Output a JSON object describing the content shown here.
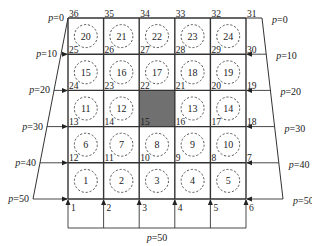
{
  "diagram": {
    "type": "finite-element-grid",
    "grid": {
      "columns": 5,
      "rows": 5
    },
    "elements": [
      {
        "id": "20",
        "row": 0,
        "col": 0
      },
      {
        "id": "21",
        "row": 0,
        "col": 1
      },
      {
        "id": "22",
        "row": 0,
        "col": 2
      },
      {
        "id": "23",
        "row": 0,
        "col": 3
      },
      {
        "id": "24",
        "row": 0,
        "col": 4
      },
      {
        "id": "15",
        "row": 1,
        "col": 0
      },
      {
        "id": "16",
        "row": 1,
        "col": 1
      },
      {
        "id": "17",
        "row": 1,
        "col": 2
      },
      {
        "id": "18",
        "row": 1,
        "col": 3
      },
      {
        "id": "19",
        "row": 1,
        "col": 4
      },
      {
        "id": "11",
        "row": 2,
        "col": 0
      },
      {
        "id": "12",
        "row": 2,
        "col": 1
      },
      {
        "id": "13",
        "row": 2,
        "col": 3
      },
      {
        "id": "14",
        "row": 2,
        "col": 4
      },
      {
        "id": "6",
        "row": 3,
        "col": 0
      },
      {
        "id": "7",
        "row": 3,
        "col": 1
      },
      {
        "id": "8",
        "row": 3,
        "col": 2
      },
      {
        "id": "9",
        "row": 3,
        "col": 3
      },
      {
        "id": "10",
        "row": 3,
        "col": 4
      },
      {
        "id": "1",
        "row": 4,
        "col": 0
      },
      {
        "id": "2",
        "row": 4,
        "col": 1
      },
      {
        "id": "3",
        "row": 4,
        "col": 2
      },
      {
        "id": "4",
        "row": 4,
        "col": 3
      },
      {
        "id": "5",
        "row": 4,
        "col": 4
      }
    ],
    "shaded_cell": {
      "row": 2,
      "col": 2,
      "color": "#707070"
    },
    "top_nodes": [
      "36",
      "35",
      "34",
      "33",
      "32",
      "31"
    ],
    "row1_nodes": [
      "25",
      "26",
      "27",
      "28",
      "29",
      "30"
    ],
    "row2_nodes": [
      "24",
      "23",
      "22",
      "21",
      "20",
      "19"
    ],
    "row3_nodes": [
      "13",
      "14",
      "15",
      "16",
      "17",
      "18"
    ],
    "row4_nodes": [
      "12",
      "11",
      "10",
      "9",
      "8",
      "7"
    ],
    "bottom_nodes": [
      "1",
      "2",
      "3",
      "4",
      "5",
      "6"
    ],
    "left_pressures": [
      "p=0",
      "p=10",
      "p=20",
      "p=30",
      "p=40",
      "p=50"
    ],
    "right_pressures": [
      "p=0",
      "p=10",
      "p=20",
      "p=30",
      "p=40",
      "p=50"
    ],
    "bottom_pressure": "p=50",
    "colors": {
      "line": "#333333",
      "shade": "#707070",
      "circle": "#444444"
    }
  }
}
